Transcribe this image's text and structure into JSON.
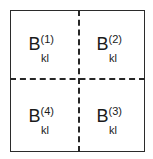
{
  "figure": {
    "background_color": "#ffffff",
    "border_color": "#2b2b2b",
    "divider_color": "#262626",
    "text_color": "#1b1b1b",
    "outer_border_style": "solid",
    "divider_style": "dashed"
  },
  "quadrants": [
    {
      "position": "top-left",
      "base": "B",
      "superscript": "(1)",
      "subscript": "kl",
      "full_label": "B(1)kl"
    },
    {
      "position": "top-right",
      "base": "B",
      "superscript": "(2)",
      "subscript": "kl",
      "full_label": "B(2)kl"
    },
    {
      "position": "bottom-right",
      "base": "B",
      "superscript": "(3)",
      "subscript": "kl",
      "full_label": "B(3)kl"
    },
    {
      "position": "bottom-left",
      "base": "B",
      "superscript": "(4)",
      "subscript": "kl",
      "full_label": "B(4)kl"
    }
  ]
}
